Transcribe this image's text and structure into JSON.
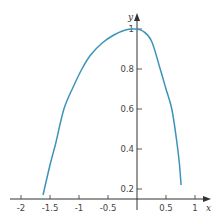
{
  "chart_data": {
    "type": "line",
    "title": "",
    "xlabel": "x",
    "ylabel": "y",
    "xlim": [
      -2.1,
      1.2
    ],
    "ylim": [
      0.15,
      1.08
    ],
    "x_ticks": [
      -2,
      -1.5,
      -1,
      -0.5,
      0.5,
      1
    ],
    "x_tick_labels": [
      "-2",
      "-1.5",
      "-1",
      "-0.5",
      "0.5",
      "1"
    ],
    "y_ticks": [
      0.2,
      0.4,
      0.6,
      0.8,
      1
    ],
    "y_tick_labels": [
      "0.2",
      "0.4",
      "0.6",
      "0.8",
      "1"
    ],
    "grid": false,
    "legend": null,
    "series": [
      {
        "name": "curve",
        "color": "#3b93b8",
        "x": [
          -1.62,
          -1.5,
          -1.4,
          -1.26,
          -1.1,
          -0.95,
          -0.8,
          -0.6,
          -0.4,
          -0.2,
          -0.05,
          0.1,
          0.25,
          0.4,
          0.5,
          0.6,
          0.68,
          0.73,
          0.76
        ],
        "y": [
          0.17,
          0.32,
          0.43,
          0.6,
          0.71,
          0.8,
          0.87,
          0.93,
          0.97,
          0.995,
          1.0,
          0.99,
          0.94,
          0.8,
          0.7,
          0.6,
          0.45,
          0.33,
          0.22
        ]
      }
    ]
  },
  "axes": {
    "x_label": "x",
    "y_label": "y",
    "axis_color": "#333333"
  }
}
